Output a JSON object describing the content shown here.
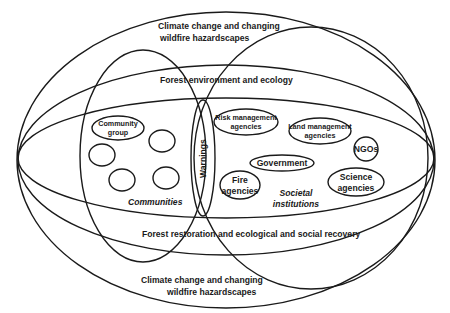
{
  "diagram": {
    "outer_layer": {
      "label_top_line1": "Climate change and changing",
      "label_top_line2": "wildfire hazardscapes",
      "label_bottom_line1": "Climate change and changing",
      "label_bottom_line2": "wildfire hazardscapes"
    },
    "middle_layer": {
      "label_top": "Forest environment and ecology",
      "label_bottom": "Forest restoration and ecological and social recovery"
    },
    "communities": {
      "label": "Communities",
      "group_line1": "Community",
      "group_line2": "group",
      "unlabeled_circles": 4
    },
    "warnings": {
      "label": "Warnings"
    },
    "societal_institutions": {
      "label_line1": "Societal",
      "label_line2": "institutions",
      "members": [
        {
          "line1": "Risk management",
          "line2": "agencies"
        },
        {
          "line1": "Land management",
          "line2": "agencies"
        },
        {
          "line1": "NGOs",
          "line2": ""
        },
        {
          "line1": "Government",
          "line2": ""
        },
        {
          "line1": "Fire",
          "line2": "agencies"
        },
        {
          "line1": "Science",
          "line2": "agencies"
        }
      ]
    },
    "colors": {
      "stroke": "#1a1a1a",
      "background": "#ffffff"
    }
  }
}
